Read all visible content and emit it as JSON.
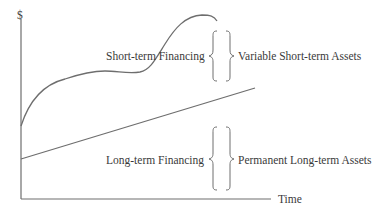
{
  "axes": {
    "y_label": "$",
    "x_label": "Time"
  },
  "labels": {
    "short_term_financing": "Short-term Financing",
    "variable_assets": "Variable Short-term Assets",
    "long_term_financing": "Long-term Financing",
    "permanent_assets": "Permanent Long-term Assets"
  },
  "colors": {
    "line": "#6e6e6e",
    "text": "#3a3a3a",
    "background": "#ffffff"
  }
}
